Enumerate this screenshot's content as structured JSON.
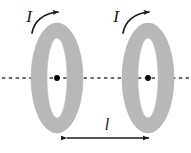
{
  "figure": {
    "kind": "physics-diagram",
    "background_color": "#ffffff",
    "width": 191,
    "height": 153
  },
  "labels": {
    "current_left": "I",
    "current_right": "I",
    "separation": "l"
  },
  "colors": {
    "ring_fill": "#b8b8b8",
    "ring_edge": "#b0b0b0",
    "ink": "#1a1a1a",
    "axis": "#3a3a3a",
    "dot": "#000000"
  },
  "loops": [
    {
      "name": "left-loop",
      "center_x": 57,
      "center_y": 78,
      "outer_rx": 26,
      "outer_ry": 55,
      "inner_rx": 10,
      "inner_ry": 40,
      "current_label": "I",
      "current_direction": "clockwise-from-left"
    },
    {
      "name": "right-loop",
      "center_x": 148,
      "center_y": 78,
      "outer_rx": 26,
      "outer_ry": 55,
      "inner_rx": 10,
      "inner_ry": 40,
      "current_label": "I",
      "current_direction": "clockwise-from-left"
    }
  ],
  "axis": {
    "name": "symmetry-axis",
    "y": 78,
    "x_start": 2,
    "x_end": 189,
    "style": "dashed"
  },
  "dimension": {
    "name": "separation-dimension",
    "label": "l",
    "y": 138,
    "x_start": 67,
    "x_end": 149,
    "label_x": 107,
    "label_y": 130,
    "arrowheads": "both"
  },
  "current_arrows": [
    {
      "name": "left-current-arrow",
      "label_x": 29,
      "label_y": 22,
      "path": "M 32 33 C 34 21, 44 13, 58 12",
      "head_x": 60,
      "head_y": 12
    },
    {
      "name": "right-current-arrow",
      "label_x": 116,
      "label_y": 22,
      "path": "M 123 33 C 125 21, 135 13, 149 12",
      "head_x": 151,
      "head_y": 12
    }
  ]
}
